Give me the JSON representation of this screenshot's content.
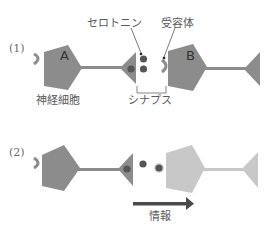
{
  "diagram": {
    "panels": [
      {
        "id": "1",
        "label": "(1)",
        "neuron_a_letter": "A",
        "neuron_b_letter": "B",
        "annotations": {
          "serotonin": "セロトニン",
          "receptor": "受容体",
          "neuron": "神経細胞",
          "synapse": "シナプス"
        }
      },
      {
        "id": "2",
        "label": "(2)",
        "arrow_label": "情報"
      }
    ],
    "colors": {
      "neuron": "#8c8c8c",
      "neuron_light": "#c8c8c8",
      "serotonin_dot": "#555555",
      "arrow": "#4a4a4a",
      "text": "#5a5a5a"
    }
  }
}
